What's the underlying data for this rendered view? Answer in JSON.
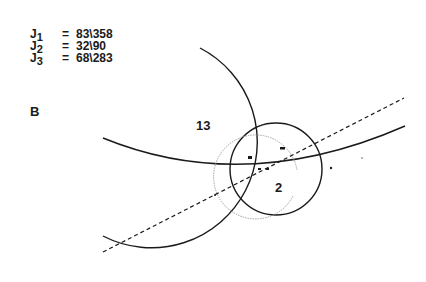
{
  "equations": [
    {
      "lhs": "J",
      "sub": "1",
      "op": "=",
      "rhs": "83\\358"
    },
    {
      "lhs": "J",
      "sub": "2",
      "op": "=",
      "rhs": "32\\90"
    },
    {
      "lhs": "J",
      "sub": "3",
      "op": "=",
      "rhs": "68\\283"
    }
  ],
  "panel_label": "B",
  "region_labels": {
    "upper_left": "13",
    "lower_right": "2"
  },
  "colors": {
    "line": "#1a1a1a",
    "faint": "#9a9a9a"
  }
}
